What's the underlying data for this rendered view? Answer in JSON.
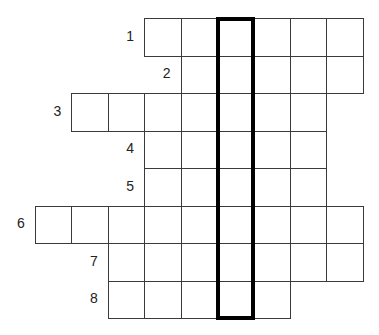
{
  "puzzle": {
    "type": "crossword-keyword",
    "grid_origin": {
      "x": 35,
      "y": 18
    },
    "cell_width": 36.4,
    "cell_height": 37.5,
    "rows": [
      {
        "number": "1",
        "start_col": 3,
        "length": 6
      },
      {
        "number": "2",
        "start_col": 4,
        "length": 5
      },
      {
        "number": "3",
        "start_col": 1,
        "length": 7
      },
      {
        "number": "4",
        "start_col": 3,
        "length": 5
      },
      {
        "number": "5",
        "start_col": 3,
        "length": 5
      },
      {
        "number": "6",
        "start_col": 0,
        "length": 9
      },
      {
        "number": "7",
        "start_col": 2,
        "length": 7
      },
      {
        "number": "8",
        "start_col": 2,
        "length": 5
      }
    ],
    "highlight_column": 5,
    "colors": {
      "cell_border": "#3a3a3a",
      "highlight_border": "#000000",
      "label": "#222222"
    }
  }
}
